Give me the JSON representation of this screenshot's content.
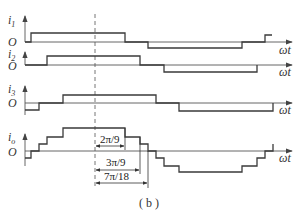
{
  "diagram": {
    "caption": "( b )",
    "x_axis_label": "ωt",
    "origin_label": "O",
    "traces": [
      {
        "name": "i1",
        "symbol": "i",
        "subscript": "1",
        "levels": "0,+1,0,-1,0,+1"
      },
      {
        "name": "i2",
        "symbol": "i",
        "subscript": "2",
        "levels": "0,+1,0,-1,0"
      },
      {
        "name": "i3",
        "symbol": "i",
        "subscript": "3",
        "levels": "-1,0,+1,0,-1,0"
      },
      {
        "name": "io",
        "symbol": "i",
        "subscript": "o",
        "levels": "stepped sum of i1,i2,i3"
      }
    ],
    "annotations": [
      {
        "label": "2π/9"
      },
      {
        "label": "3π/9"
      },
      {
        "label": "7π/18"
      }
    ],
    "colors": {
      "stroke": "#3a3a3a",
      "background": "#ffffff"
    }
  }
}
